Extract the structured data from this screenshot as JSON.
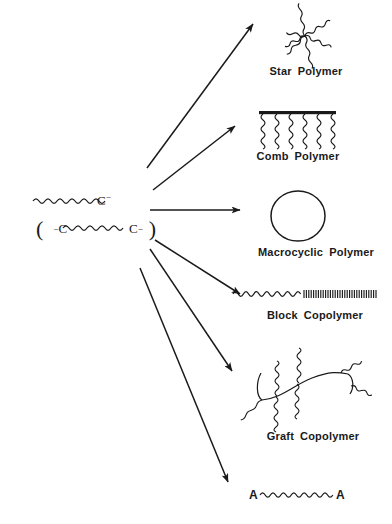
{
  "figure": {
    "background_color": "#ffffff",
    "ink_color": "#1a1a1a",
    "width": 392,
    "height": 524
  },
  "reactants": {
    "monoanion": {
      "chain_label": "wavy-chain",
      "carbon": "C",
      "charge": "−"
    },
    "dianion": {
      "open_paren": "(",
      "charge_left": "−",
      "carbon_left": "C",
      "chain_label": "wavy-chain",
      "carbon_right": "C",
      "charge_right": "−",
      "close_paren": ")"
    }
  },
  "products": [
    {
      "id": "star",
      "label": "Star Polymer",
      "label_words": [
        "Star",
        "Polymer"
      ],
      "structure": "six-armed-wavy-star",
      "arms": 6
    },
    {
      "id": "comb",
      "label": "Comb Polymer",
      "label_words": [
        "Comb",
        "Polymer"
      ],
      "structure": "thick-backbone-with-wavy-teeth",
      "teeth": 6
    },
    {
      "id": "macrocyclic",
      "label": "Macrocyclic Polymer",
      "label_words": [
        "Macrocyclic",
        "Polymer"
      ],
      "structure": "closed-ring-circle"
    },
    {
      "id": "block",
      "label": "Block Copolymer",
      "label_words": [
        "Block",
        "Copolymer"
      ],
      "structure": "wavy-segment-joined-to-hatched-segment"
    },
    {
      "id": "graft",
      "label": "Graft Copolymer",
      "label_words": [
        "Graft",
        "Copolymer"
      ],
      "structure": "curved-backbone-with-wavy-grafts"
    },
    {
      "id": "telechelic",
      "label": "",
      "label_words": [],
      "structure": "wavy-chain-with-A-end-groups",
      "end_group_left": "A",
      "end_group_right": "A"
    }
  ],
  "arrows": {
    "count": 6,
    "description": "fan of straight arrows from reactant anions to each product",
    "items": [
      {
        "to": "star",
        "direction": "up-right"
      },
      {
        "to": "comb",
        "direction": "up-right"
      },
      {
        "to": "macrocyclic",
        "direction": "right"
      },
      {
        "to": "block",
        "direction": "down-right"
      },
      {
        "to": "graft",
        "direction": "down-right"
      },
      {
        "to": "telechelic",
        "direction": "down-right"
      }
    ]
  }
}
